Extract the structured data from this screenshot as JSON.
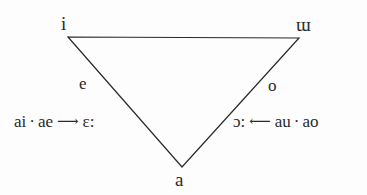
{
  "figure": {
    "name": "vowel-triangle-diagram",
    "background_color": "#fdfdfd",
    "line_color": "#2a2a2a",
    "text_color": "#2a2a2a"
  },
  "triangle": {
    "vertices": {
      "top_left": {
        "x": 68,
        "y": 37
      },
      "top_right": {
        "x": 299,
        "y": 38
      },
      "bottom": {
        "x": 182,
        "y": 167
      }
    },
    "stroke_width": 1.2
  },
  "vertex_labels": [
    {
      "id": "i",
      "text": "i",
      "position": "top-left"
    },
    {
      "id": "turned-m",
      "text": "ɯ",
      "position": "top-right"
    },
    {
      "id": "a",
      "text": "a",
      "position": "bottom"
    }
  ],
  "inner_labels": [
    {
      "id": "e",
      "text": "e",
      "position": "left-leg"
    },
    {
      "id": "o",
      "text": "o",
      "position": "right-leg"
    }
  ],
  "rules": {
    "left": {
      "source_1": "ai",
      "separator": "·",
      "source_2": "ae",
      "arrow": "⟶",
      "result": "ɛ:"
    },
    "right": {
      "result": "ɔ:",
      "arrow": "⟵",
      "source_1": "au",
      "separator": "·",
      "source_2": "ao"
    }
  }
}
